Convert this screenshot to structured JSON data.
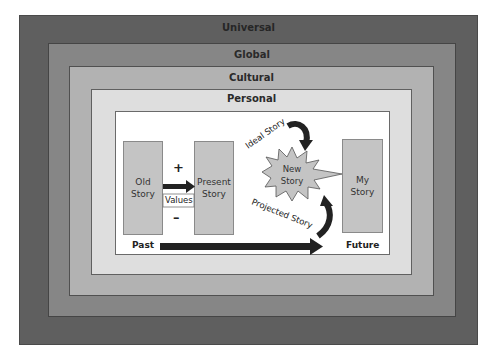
{
  "layers": {
    "universal": {
      "label": "Universal",
      "color": "#5f5f5f"
    },
    "global": {
      "label": "Global",
      "color": "#868686"
    },
    "cultural": {
      "label": "Cultural",
      "color": "#b2b2b2"
    },
    "personal": {
      "label": "Personal",
      "color": "#dedede"
    }
  },
  "diagram": {
    "old_story": {
      "line1": "Old",
      "line2": "Story"
    },
    "present_story": {
      "line1": "Present",
      "line2": "Story"
    },
    "my_story": {
      "line1": "My",
      "line2": "Story"
    },
    "new_story": {
      "line1": "New",
      "line2": "Story"
    },
    "plus_sign": "+",
    "minus_sign": "–",
    "values_label": "Values",
    "ideal_story_label": "Ideal Story",
    "projected_story_label": "Projected Story",
    "past_label": "Past",
    "future_label": "Future"
  }
}
